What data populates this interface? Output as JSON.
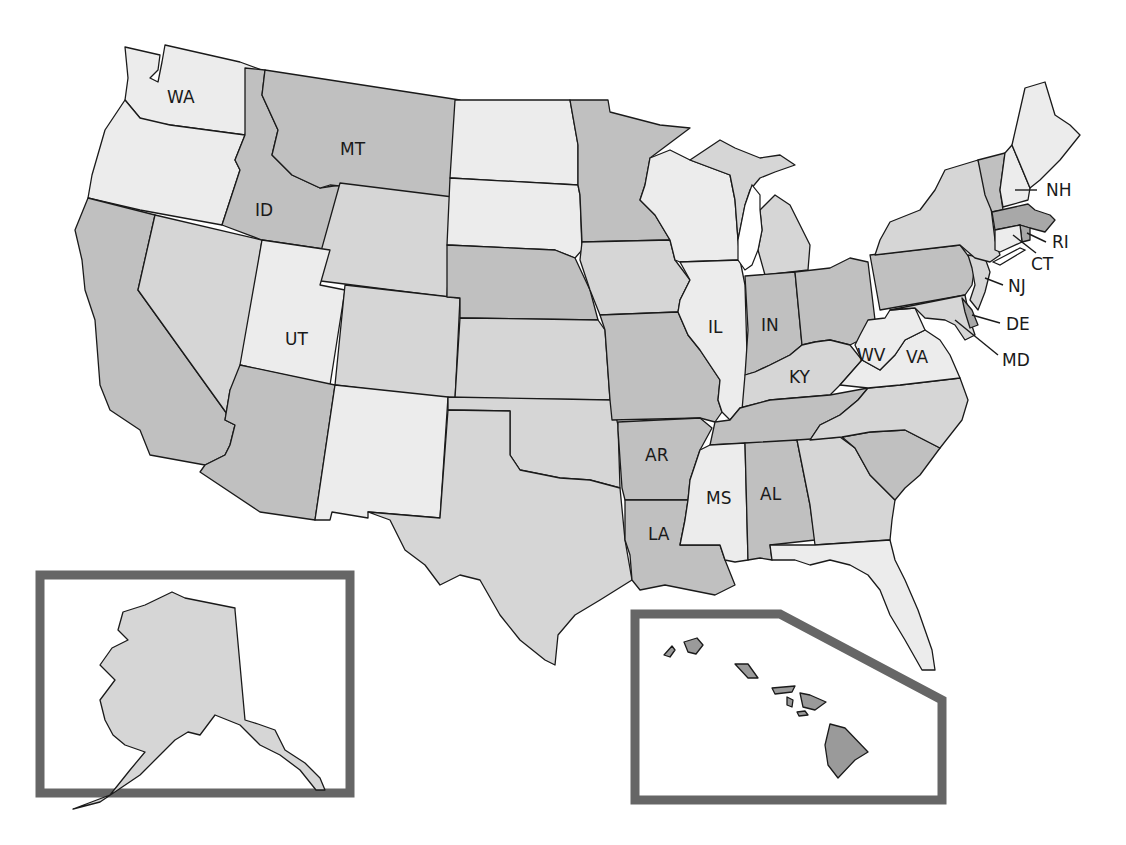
{
  "map": {
    "colors": {
      "light": "#ececec",
      "medium": "#d6d6d6",
      "dark": "#c0c0c0",
      "darker": "#a8a8a8",
      "hawaii": "#9a9a9a",
      "stroke": "#1a1a1a",
      "frame": "#666666"
    },
    "labels": {
      "WA": "WA",
      "MT": "MT",
      "ID": "ID",
      "UT": "UT",
      "IL": "IL",
      "IN": "IN",
      "KY": "KY",
      "WV": "WV",
      "VA": "VA",
      "AR": "AR",
      "MS": "MS",
      "AL": "AL",
      "LA": "LA",
      "NH": "NH",
      "RI": "RI",
      "CT": "CT",
      "NJ": "NJ",
      "DE": "DE",
      "MD": "MD"
    },
    "state_shading": {
      "WA": "light",
      "OR": "light",
      "CA": "dark",
      "NV": "medium",
      "ID": "dark",
      "MT": "dark",
      "WY": "medium",
      "UT": "light",
      "CO": "medium",
      "AZ": "dark",
      "NM": "light",
      "ND": "light",
      "SD": "light",
      "NE": "dark",
      "KS": "medium",
      "OK": "medium",
      "TX": "medium",
      "MN": "dark",
      "IA": "medium",
      "MO": "dark",
      "AR": "dark",
      "LA": "dark",
      "WI": "light",
      "IL": "light",
      "MI": "medium",
      "IN": "dark",
      "OH": "dark",
      "KY": "medium",
      "TN": "dark",
      "MS": "light",
      "AL": "dark",
      "GA": "medium",
      "FL": "light",
      "SC": "dark",
      "NC": "medium",
      "VA": "light",
      "WV": "light",
      "PA": "dark",
      "NY": "medium",
      "VT": "dark",
      "NH": "light",
      "ME": "light",
      "MA": "darker",
      "RI": "darker",
      "CT": "light",
      "NJ": "medium",
      "DE": "darker",
      "MD": "medium",
      "AK": "medium",
      "HI": "hawaii"
    }
  }
}
